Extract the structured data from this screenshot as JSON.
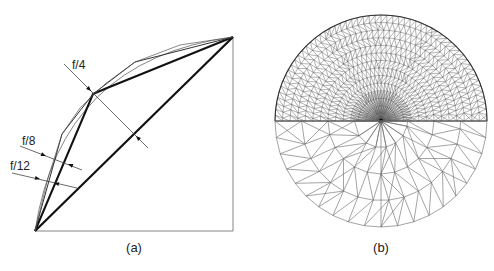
{
  "figure": {
    "panels": [
      {
        "id": "a",
        "caption": "(a)",
        "caption_pos": [
          134,
          252
        ],
        "square": {
          "x0": 35,
          "y0": 37,
          "x1": 233,
          "y1": 231
        },
        "arc": {
          "from": [
            35,
            231
          ],
          "to": [
            233,
            37
          ],
          "bulge": 52
        },
        "polylines": [
          {
            "name": "chord",
            "points": [
              [
                35,
                231
              ],
              [
                233,
                37
              ]
            ],
            "width": 2.2,
            "color": "#111111"
          },
          {
            "name": "f4-polyline",
            "points": [
              [
                35,
                231
              ],
              [
                93,
                94
              ],
              [
                107,
                88
              ],
              [
                233,
                37
              ]
            ],
            "width": 2.0,
            "color": "#111111"
          },
          {
            "name": "f8-polyline",
            "points": [
              [
                35,
                231
              ],
              [
                62,
                134
              ],
              [
                93,
                94
              ],
              [
                135,
                62
              ],
              [
                233,
                37
              ]
            ],
            "width": 1.0,
            "color": "#333333"
          },
          {
            "name": "f12-polyline",
            "points": [
              [
                35,
                231
              ],
              [
                48,
                178
              ],
              [
                62,
                134
              ],
              [
                80,
                108
              ],
              [
                105,
                84
              ],
              [
                135,
                62
              ],
              [
                180,
                45
              ],
              [
                233,
                37
              ]
            ],
            "width": 0.7,
            "color": "#555555"
          }
        ],
        "annotations": [
          {
            "label": "f/4",
            "label_pos": [
              72,
              69
            ],
            "line": [
              [
                64,
                64
              ],
              [
                148,
                148
              ]
            ],
            "arrows": [
              [
                91,
                91,
                1
              ],
              [
                136,
                136,
                -1
              ]
            ]
          },
          {
            "label": "f/8",
            "label_pos": [
              22,
              145
            ],
            "line": [
              [
                20,
                146
              ],
              [
                82,
                170
              ]
            ],
            "arrows": [
              [
                46,
                156,
                1
              ],
              [
                68,
                164,
                -1
              ]
            ]
          },
          {
            "label": "f/12",
            "label_pos": [
              10,
              170
            ],
            "line": [
              [
                12,
                173
              ],
              [
                77,
                188
              ]
            ],
            "arrows": [
              [
                40,
                179,
                1
              ],
              [
                54,
                183,
                -1
              ]
            ]
          }
        ]
      },
      {
        "id": "b",
        "caption": "(b)",
        "caption_pos": [
          381,
          252
        ],
        "circle": {
          "cx": 381,
          "cy": 121,
          "r": 106
        },
        "upper_mesh": {
          "rings": 14,
          "spokes": 56,
          "style": "dense-geodesic"
        },
        "lower_mesh": {
          "rings": 4,
          "style": "coarse-triangular"
        }
      }
    ]
  }
}
